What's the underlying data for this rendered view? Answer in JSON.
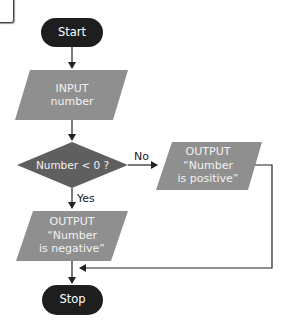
{
  "colors": {
    "terminal": "#1e1e1e",
    "io_shape": "#8f8f8f",
    "decision": "#5f5f5f",
    "line": "#222222"
  },
  "nodes": {
    "start": {
      "label": "Start"
    },
    "input": {
      "line1": "INPUT",
      "line2": "number"
    },
    "decision": {
      "label": "Number < 0 ?"
    },
    "output_positive": {
      "line1": "OUTPUT",
      "line2": "“Number",
      "line3": "is positive”"
    },
    "output_negative": {
      "line1": "OUTPUT",
      "line2": "“Number",
      "line3": "is negative”"
    },
    "stop": {
      "label": "Stop"
    }
  },
  "edges": {
    "no_label": "No",
    "yes_label": "Yes"
  }
}
